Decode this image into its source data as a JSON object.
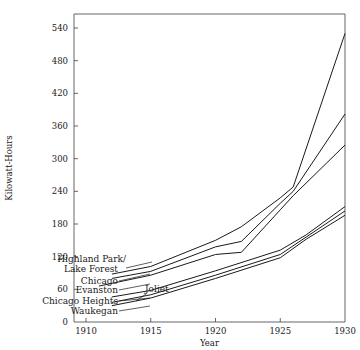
{
  "chart_data": {
    "type": "line",
    "title": "",
    "xlabel": "Year",
    "ylabel": "Kilowatt-Hours",
    "xlim": [
      1908,
      1930
    ],
    "ylim": [
      0,
      560
    ],
    "xticks": [
      1910,
      1915,
      1920,
      1925,
      1930
    ],
    "xtick_labels": [
      "1910",
      "1915",
      "1920",
      "1925",
      "1930"
    ],
    "yticks": [
      0,
      60,
      120,
      180,
      240,
      300,
      360,
      420,
      480,
      540
    ],
    "ytick_labels": [
      "0",
      "60",
      "120",
      "180",
      "240",
      "300",
      "360",
      "420",
      "480",
      "540"
    ],
    "grid": false,
    "legend": "inline-labels",
    "line_color": "#1a1a1a",
    "axis_color": "#555555",
    "series": [
      {
        "name": "Highland Park/ Lake Forest",
        "label_lines": [
          "Highland Park/",
          "Lake Forest"
        ],
        "x": [
          1912,
          1915,
          1920,
          1922,
          1925,
          1926,
          1930
        ],
        "values": [
          88,
          102,
          150,
          175,
          228,
          248,
          530
        ]
      },
      {
        "name": "Chicago",
        "label_lines": [
          "Chicago"
        ],
        "x": [
          1912,
          1915,
          1920,
          1922,
          1925,
          1926,
          1930
        ],
        "values": [
          80,
          93,
          138,
          148,
          218,
          240,
          382
        ]
      },
      {
        "name": "Evanston",
        "label_lines": [
          "Evanston"
        ],
        "x": [
          1911,
          1915,
          1920,
          1922,
          1925,
          1926,
          1930
        ],
        "values": [
          66,
          86,
          124,
          128,
          206,
          232,
          325
        ]
      },
      {
        "name": "Joliet",
        "label_lines": [
          "Joliet"
        ],
        "x": [
          1912,
          1915,
          1920,
          1925,
          1927,
          1930
        ],
        "values": [
          46,
          58,
          94,
          132,
          160,
          212
        ]
      },
      {
        "name": "Chicago Heights",
        "label_lines": [
          "Chicago Heights"
        ],
        "x": [
          1912,
          1915,
          1920,
          1925,
          1927,
          1930
        ],
        "values": [
          36,
          50,
          86,
          124,
          156,
          204
        ]
      },
      {
        "name": "Waukegan",
        "label_lines": [
          "Waukegan"
        ],
        "x": [
          1912,
          1915,
          1920,
          1925,
          1927,
          1930
        ],
        "values": [
          30,
          44,
          80,
          118,
          152,
          196
        ]
      }
    ],
    "annotations": [
      {
        "text": "Highland Park/",
        "x": 60,
        "y": 262
      },
      {
        "text": "Lake Forest",
        "x": 68,
        "y": 272
      },
      {
        "text": "Chicago",
        "x": 77,
        "y": 284
      },
      {
        "text": "Evanston",
        "x": 72,
        "y": 293
      },
      {
        "text": "Chicago Heights",
        "x": 40,
        "y": 304
      },
      {
        "text": "Waukegan",
        "x": 64,
        "y": 314
      },
      {
        "text": "Joliet",
        "x": 145,
        "y": 292
      }
    ]
  }
}
